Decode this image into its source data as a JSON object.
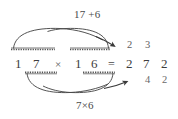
{
  "figure": {
    "type": "multiplication-trick-diagram",
    "ink_color": "#3d3d3d",
    "background_color": "#ffffff",
    "annotation_color": "#4a4a4a"
  },
  "equation": {
    "left_operand": {
      "digits": [
        "1",
        "7"
      ],
      "value": "17"
    },
    "multiply_sign": "×",
    "right_operand": {
      "digits": [
        "1",
        "6"
      ],
      "value": "16"
    },
    "equals_sign": "=",
    "result_digits": [
      "2",
      "7",
      "2"
    ],
    "result_value": "272"
  },
  "workings": {
    "carry_row": {
      "digits": [
        "2",
        "3"
      ],
      "description": "partial sums written above the product"
    },
    "lower_row": {
      "digits": [
        "4",
        "2"
      ],
      "description": "partial product written below the product"
    }
  },
  "annotations": {
    "top_label": "17 +6",
    "bottom_label": "7×6"
  },
  "arrows": {
    "top_arrow": {
      "label_ref": "annotations.top_label",
      "from": "7 in 17 / 1 in 16",
      "to": "carry row at result",
      "direction": "left-to-right"
    },
    "bottom_arrow": {
      "label_ref": "annotations.bottom_label",
      "from": "7 in 17",
      "to": "lower row at result",
      "direction": "left-to-right"
    }
  },
  "marks": {
    "overline_left": "above 1 7",
    "overline_right": "above 1 6",
    "underline_left": "below 1 7",
    "underline_right": "below 1 6"
  }
}
